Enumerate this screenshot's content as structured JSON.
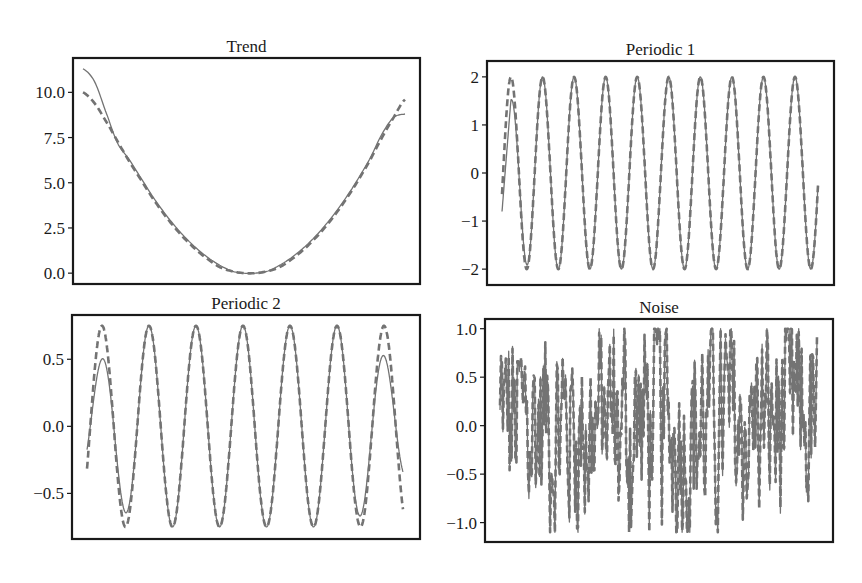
{
  "figure": {
    "colors": {
      "line": "#737373",
      "frame": "#1a1a1a",
      "text": "#1a1a1a",
      "background": "#ffffff"
    }
  },
  "chart_data": [
    {
      "id": "trend",
      "type": "line",
      "title": "Trend",
      "xlabel": "",
      "ylabel": "",
      "yticks": [
        0.0,
        2.5,
        5.0,
        7.5,
        10.0
      ],
      "ytick_labels": [
        "0.0",
        "2.5",
        "5.0",
        "7.5",
        "10.0"
      ],
      "ylim": [
        -0.6,
        11.9
      ],
      "frame": {
        "left": 73,
        "top": 58,
        "right": 420,
        "bottom": 284
      },
      "xrange_px": [
        83,
        405
      ],
      "series": [
        {
          "name": "actual",
          "style": "solid",
          "values": [
            11.3,
            10.6,
            8.9,
            7.2,
            6.3,
            5.3,
            4.3,
            3.4,
            2.6,
            1.9,
            1.3,
            0.8,
            0.4,
            0.1,
            0.0,
            0.0,
            0.1,
            0.4,
            0.8,
            1.3,
            1.9,
            2.6,
            3.4,
            4.3,
            5.3,
            6.4,
            7.7,
            8.6,
            8.8
          ]
        },
        {
          "name": "fitted",
          "style": "dashed",
          "values": [
            10.0,
            9.4,
            8.4,
            7.3,
            6.2,
            5.2,
            4.2,
            3.3,
            2.5,
            1.8,
            1.2,
            0.7,
            0.3,
            0.1,
            0.0,
            0.0,
            0.1,
            0.3,
            0.7,
            1.2,
            1.8,
            2.5,
            3.3,
            4.2,
            5.2,
            6.3,
            7.5,
            8.6,
            9.6
          ]
        }
      ]
    },
    {
      "id": "periodic1",
      "type": "line",
      "title": "Periodic 1",
      "xlabel": "",
      "ylabel": "",
      "yticks": [
        -2,
        -1,
        0,
        1,
        2
      ],
      "ytick_labels": [
        "−2",
        "−1",
        "0",
        "1",
        "2"
      ],
      "ylim": [
        -2.33,
        2.33
      ],
      "frame": {
        "left": 487,
        "top": 61,
        "right": 834,
        "bottom": 285
      },
      "xrange_px": [
        502,
        818
      ],
      "periods": 10,
      "series": [
        {
          "name": "actual",
          "style": "solid",
          "amplitude": 2.0,
          "first_peak": 1.3,
          "start_value": -0.8,
          "end_value": -0.3
        },
        {
          "name": "fitted",
          "style": "dashed",
          "amplitude": 2.0,
          "start_value": 0.0,
          "end_value": -0.8
        }
      ],
      "peak_x_px": [
        511,
        543,
        574,
        605,
        637,
        668,
        699,
        731,
        763,
        795
      ]
    },
    {
      "id": "periodic2",
      "type": "line",
      "title": "Periodic 2",
      "xlabel": "",
      "ylabel": "",
      "yticks": [
        -0.5,
        0.0,
        0.5
      ],
      "ytick_labels": [
        "−0.5",
        "0.0",
        "0.5"
      ],
      "ylim": [
        -0.84,
        0.83
      ],
      "frame": {
        "left": 72,
        "top": 315,
        "right": 420,
        "bottom": 539
      },
      "xrange_px": [
        87,
        403
      ],
      "periods": 7,
      "series": [
        {
          "name": "actual",
          "style": "solid",
          "amplitude": 0.75,
          "first_peak": 0.3,
          "first_trough": -0.5,
          "last_trough": -0.55,
          "last_peak": 0.35,
          "start_value": -0.3,
          "end_value": -0.7
        },
        {
          "name": "fitted",
          "style": "dashed",
          "amplitude": 0.75,
          "start_value": 0.0,
          "end_value": -0.55
        }
      ],
      "peak_x_px": [
        102,
        149,
        195,
        242,
        288,
        335,
        384
      ]
    },
    {
      "id": "noise",
      "type": "line",
      "title": "Noise",
      "xlabel": "",
      "ylabel": "",
      "yticks": [
        -1.0,
        -0.5,
        0.0,
        0.5,
        1.0
      ],
      "ytick_labels": [
        "−1.0",
        "−0.5",
        "0.0",
        "0.5",
        "1.0"
      ],
      "ylim": [
        -1.2,
        1.1
      ],
      "frame": {
        "left": 485,
        "top": 319,
        "right": 833,
        "bottom": 542
      },
      "xrange_px": [
        500,
        817
      ],
      "value_range": [
        -1.1,
        1.0
      ],
      "series": [
        {
          "name": "actual",
          "style": "solid",
          "description": "random noise"
        },
        {
          "name": "fitted",
          "style": "dashed",
          "description": "random noise"
        }
      ]
    }
  ]
}
